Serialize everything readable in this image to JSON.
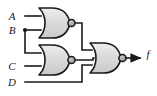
{
  "diagram": {
    "background_color": "#ffffff",
    "line_color": "#1a1a1a",
    "gate_fill_color": "#d4d4d4",
    "gate_fill_light": "#efefef",
    "bubble_fill_color": "#a8a8a8",
    "inputs": [
      {
        "id": "A",
        "label": "A",
        "y": 16
      },
      {
        "id": "B",
        "label": "B",
        "y": 30
      },
      {
        "id": "C",
        "label": "C",
        "y": 66
      },
      {
        "id": "D",
        "label": "D",
        "y": 82
      }
    ],
    "outputs": [
      {
        "id": "f",
        "label": "f",
        "y": 58
      }
    ],
    "gates": [
      {
        "id": "gate1",
        "type": "NOR",
        "label": "nor-gate-1",
        "inputs": [
          "A",
          "B"
        ],
        "output": "n1"
      },
      {
        "id": "gate2",
        "type": "NOR",
        "label": "nor-gate-2",
        "inputs": [
          "B",
          "C"
        ],
        "output": "n2"
      },
      {
        "id": "gate3",
        "type": "NOR",
        "label": "nor-gate-3",
        "inputs": [
          "n1",
          "n2",
          "D"
        ],
        "output": "f"
      }
    ],
    "junctions": [
      {
        "id": "b-branch",
        "x": 25,
        "y": 30
      }
    ]
  }
}
